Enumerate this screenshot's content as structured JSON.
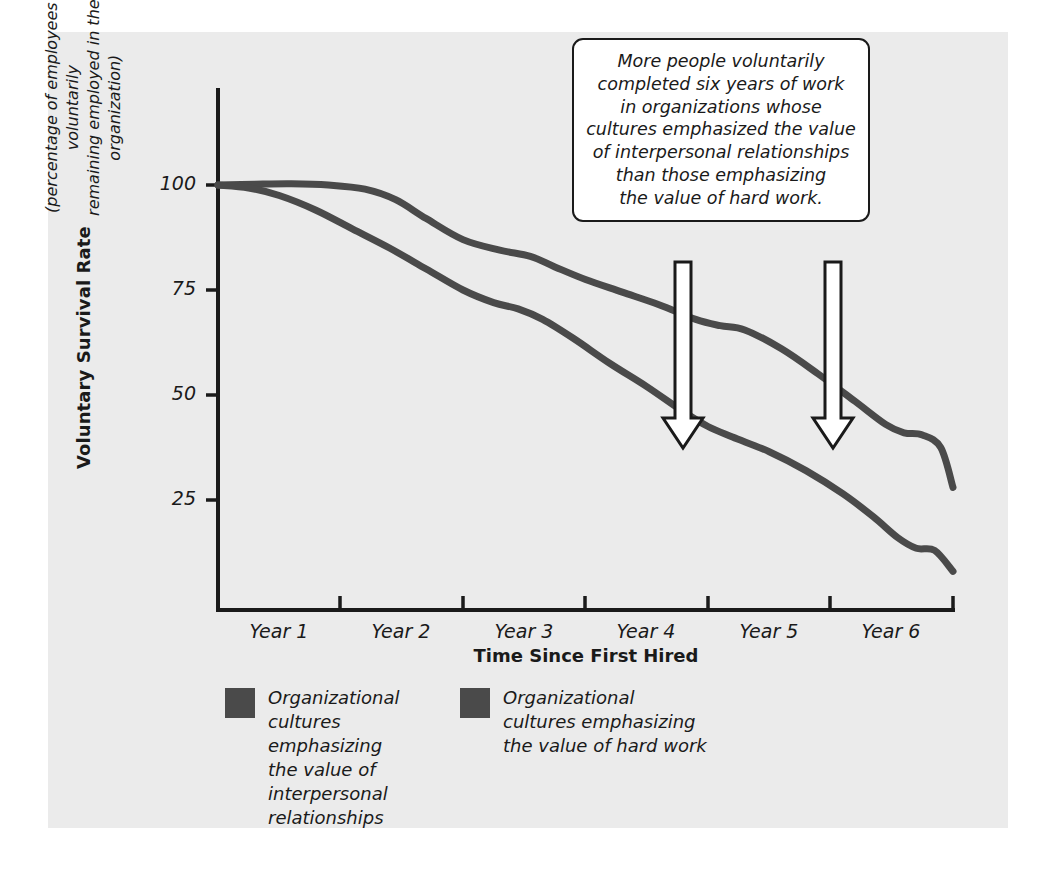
{
  "chart_data": {
    "type": "line",
    "title": "",
    "xlabel": "Time Since First Hired",
    "ylabel": "Voluntary Survival Rate",
    "ylabel_sub": "(percentage of employees voluntarily\nremaining employed in the organization)",
    "xtick_labels": [
      "Year 1",
      "Year 2",
      "Year 3",
      "Year 4",
      "Year 5",
      "Year 6"
    ],
    "ytick_labels": [
      "100",
      "75",
      "50",
      "25"
    ],
    "ytick_values": [
      100,
      75,
      50,
      25
    ],
    "ylim": [
      0,
      118
    ],
    "xlim": [
      0,
      6
    ],
    "grid": false,
    "legend_position": "below-axes",
    "series": [
      {
        "name": "Organizational\ncultures emphasizing\nthe value of\ninterpersonal\nrelationships",
        "color": "#4a4a4a",
        "x": [
          0.0,
          0.3,
          0.6,
          0.9,
          1.2,
          1.45,
          1.7,
          2.0,
          2.3,
          2.55,
          2.75,
          3.0,
          3.3,
          3.6,
          3.9,
          4.1,
          4.3,
          4.6,
          4.9,
          5.2,
          5.45,
          5.6,
          5.75,
          5.9,
          6.0
        ],
        "values": [
          100.0,
          100.2,
          100.3,
          100.0,
          99.0,
          96.5,
          92.0,
          87.0,
          84.5,
          83.0,
          80.5,
          77.5,
          74.5,
          71.5,
          68.0,
          66.5,
          65.5,
          61.0,
          55.0,
          48.5,
          43.0,
          41.0,
          40.5,
          37.5,
          28.0
        ]
      },
      {
        "name": "Organizational\ncultures emphasizing\nthe value of hard work",
        "color": "#4a4a4a",
        "x": [
          0.0,
          0.25,
          0.5,
          0.8,
          1.1,
          1.4,
          1.7,
          2.0,
          2.25,
          2.45,
          2.65,
          2.9,
          3.2,
          3.5,
          3.8,
          4.0,
          4.2,
          4.5,
          4.8,
          5.1,
          5.35,
          5.55,
          5.7,
          5.85,
          6.0
        ],
        "values": [
          100.0,
          99.3,
          97.5,
          94.0,
          89.5,
          85.0,
          80.0,
          75.0,
          72.0,
          70.5,
          68.0,
          63.5,
          57.5,
          52.0,
          46.0,
          42.5,
          40.0,
          36.5,
          32.0,
          26.5,
          21.0,
          16.0,
          13.5,
          13.0,
          8.0
        ]
      }
    ],
    "annotations": [
      {
        "name": "callout-note",
        "text": "More people voluntarily\ncompleted six years of work\nin organizations whose\ncultures emphasized the value\nof interpersonal relationships\nthan those emphasizing\nthe value of hard work.",
        "arrows": [
          {
            "name": "arrow-to-interpersonal-curve",
            "x": 4.18,
            "points_to": "interpersonal"
          },
          {
            "name": "arrow-to-hardwork-curve",
            "x": 5.42,
            "points_to": "interpersonal-late"
          }
        ]
      }
    ],
    "colors": {
      "panel_background": "#ebebeb",
      "page_background": "#ffffff",
      "axis": "#1a1a1a",
      "series_line": "#4a4a4a",
      "legend_swatch": "#4a4a4a",
      "text": "#1a1a1a",
      "callout_fill": "#ffffff",
      "callout_border": "#1a1a1a"
    }
  }
}
